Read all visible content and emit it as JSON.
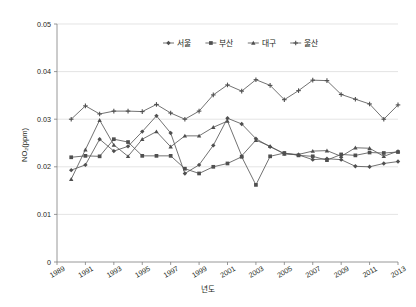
{
  "chart_data": {
    "type": "line",
    "title": "",
    "xlabel": "년도",
    "ylabel": "NO₂(ppm)",
    "ylim": [
      0,
      0.05
    ],
    "xlim": [
      1989,
      2013
    ],
    "grid": true,
    "legend_position": "top-center",
    "y_ticks": [
      "0",
      "0.01",
      "0.02",
      "0.03",
      "0.04",
      "0.05"
    ],
    "y_tick_values": [
      0,
      0.01,
      0.02,
      0.03,
      0.04,
      0.05
    ],
    "x_ticks": [
      "1989",
      "1991",
      "1993",
      "1995",
      "1997",
      "1999",
      "2001",
      "2003",
      "2005",
      "2007",
      "2009",
      "2011",
      "2013"
    ],
    "x_tick_values": [
      1989,
      1991,
      1993,
      1995,
      1997,
      1999,
      2001,
      2003,
      2005,
      2007,
      2009,
      2011,
      2013
    ],
    "x": [
      1990,
      1991,
      1992,
      1993,
      1994,
      1995,
      1996,
      1997,
      1998,
      1999,
      2000,
      2001,
      2002,
      2003,
      2004,
      2005,
      2006,
      2007,
      2008,
      2009,
      2010,
      2011,
      2012,
      2013
    ],
    "series": [
      {
        "name": "서울",
        "marker": "diamond",
        "color": "#595959",
        "values": [
          0.0193,
          0.0204,
          0.0258,
          0.0233,
          0.0243,
          0.0274,
          0.0307,
          0.0271,
          0.0186,
          0.0204,
          0.0245,
          0.0302,
          0.029,
          0.0259,
          0.0242,
          0.0228,
          0.0225,
          0.0215,
          0.0217,
          0.0215,
          0.0201,
          0.02,
          0.0207,
          0.0211
        ]
      },
      {
        "name": "부산",
        "marker": "square",
        "color": "#595959",
        "values": [
          0.022,
          0.0223,
          0.0222,
          0.0258,
          0.0252,
          0.0223,
          0.0223,
          0.0223,
          0.0196,
          0.0186,
          0.02,
          0.0207,
          0.0221,
          0.0162,
          0.0222,
          0.0229,
          0.0224,
          0.0222,
          0.0214,
          0.0226,
          0.0224,
          0.023,
          0.0229,
          0.0231
        ]
      },
      {
        "name": "대구",
        "marker": "triangle",
        "color": "#595959",
        "values": [
          0.0174,
          0.0236,
          0.0298,
          0.0246,
          0.0222,
          0.0258,
          0.0274,
          0.0242,
          0.0265,
          0.0265,
          0.0283,
          0.0296,
          0.0223,
          0.0256,
          0.0243,
          0.0227,
          0.0226,
          0.0233,
          0.0234,
          0.0222,
          0.024,
          0.0239,
          0.0222,
          0.0233
        ]
      },
      {
        "name": "울산",
        "marker": "cross",
        "color": "#595959",
        "values": [
          0.03,
          0.0328,
          0.0311,
          0.0317,
          0.0317,
          0.0316,
          0.0331,
          0.0313,
          0.03,
          0.0317,
          0.0351,
          0.0372,
          0.0359,
          0.0383,
          0.0371,
          0.0341,
          0.036,
          0.0382,
          0.0381,
          0.0352,
          0.0342,
          0.0332,
          0.03,
          0.033
        ]
      }
    ]
  },
  "legend": {
    "items": [
      {
        "label": "서울"
      },
      {
        "label": "부산"
      },
      {
        "label": "대구"
      },
      {
        "label": "울산"
      }
    ]
  }
}
